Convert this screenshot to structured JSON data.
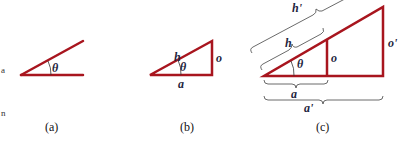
{
  "colors": {
    "line": "#a8151e",
    "arc": "#333333",
    "brace": "#444444",
    "text": "#1f2540"
  },
  "panels": [
    {
      "id": "a",
      "caption": "(a)",
      "labels": {
        "angle": "θ"
      }
    },
    {
      "id": "b",
      "caption": "(b)",
      "labels": {
        "hypotenuse": "h",
        "angle": "θ",
        "opposite": "o",
        "adjacent": "a"
      }
    },
    {
      "id": "c",
      "caption": "(c)",
      "labels": {
        "big_hypotenuse": "h'",
        "hypotenuse": "h",
        "angle": "θ",
        "opposite": "o",
        "big_opposite": "o'",
        "adjacent": "a",
        "big_adjacent": "a'"
      }
    }
  ],
  "edge_text": [
    "a",
    "n"
  ]
}
